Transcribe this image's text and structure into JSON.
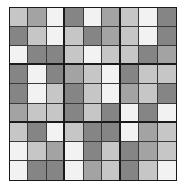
{
  "puzzle": {
    "size": 9,
    "box_size": 3,
    "shade_colors": {
      "W": "#f2f2f2",
      "L": "#c6c6c6",
      "M": "#a3a3a3",
      "D": "#858585"
    },
    "rows": [
      [
        "L",
        "M",
        "W",
        "D",
        "W",
        "M",
        "L",
        "W",
        "D"
      ],
      [
        "D",
        "L",
        "W",
        "L",
        "D",
        "M",
        "L",
        "W",
        "D"
      ],
      [
        "W",
        "D",
        "D",
        "L",
        "W",
        "L",
        "L",
        "D",
        "M"
      ],
      [
        "D",
        "W",
        "D",
        "M",
        "L",
        "W",
        "D",
        "L",
        "L"
      ],
      [
        "D",
        "W",
        "L",
        "D",
        "L",
        "W",
        "M",
        "L",
        "D"
      ],
      [
        "M",
        "L",
        "L",
        "D",
        "L",
        "D",
        "W",
        "D",
        "W"
      ],
      [
        "L",
        "D",
        "W",
        "L",
        "D",
        "D",
        "W",
        "M",
        "L"
      ],
      [
        "W",
        "L",
        "M",
        "W",
        "D",
        "L",
        "D",
        "M",
        "L"
      ],
      [
        "W",
        "D",
        "D",
        "W",
        "M",
        "L",
        "D",
        "L",
        "W"
      ]
    ]
  }
}
